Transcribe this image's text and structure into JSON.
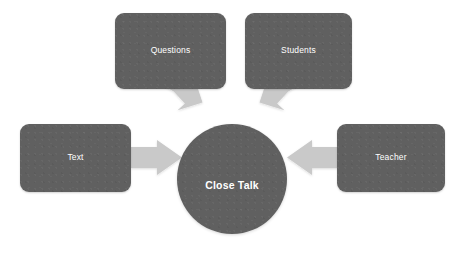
{
  "diagram": {
    "type": "radial-converging",
    "title_center": "Close Talk",
    "background_color": "#ffffff",
    "node_fill_color": "#606060",
    "node_text_color": "#ffffff",
    "arrow_color": "#c9c9c9",
    "center": {
      "label": "Close Talk",
      "shape": "circle",
      "x": 177,
      "y": 124,
      "diameter": 110
    },
    "nodes": [
      {
        "id": "questions",
        "label": "Questions",
        "shape": "rounded-rectangle",
        "x": 115,
        "y": 13,
        "width": 111,
        "height": 76
      },
      {
        "id": "students",
        "label": "Students",
        "shape": "rounded-rectangle",
        "x": 245,
        "y": 13,
        "width": 107,
        "height": 76
      },
      {
        "id": "text",
        "label": "Text",
        "shape": "rounded-rectangle",
        "x": 20,
        "y": 124,
        "width": 111,
        "height": 68
      },
      {
        "id": "teacher",
        "label": "Teacher",
        "shape": "rounded-rectangle",
        "x": 337,
        "y": 124,
        "width": 108,
        "height": 68
      }
    ],
    "arrows": [
      {
        "id": "questions-to-center",
        "from": "questions",
        "to": "center",
        "direction": "down-right"
      },
      {
        "id": "students-to-center",
        "from": "students",
        "to": "center",
        "direction": "down-left"
      },
      {
        "id": "text-to-center",
        "from": "text",
        "to": "center",
        "direction": "right"
      },
      {
        "id": "teacher-to-center",
        "from": "teacher",
        "to": "center",
        "direction": "left"
      }
    ]
  }
}
